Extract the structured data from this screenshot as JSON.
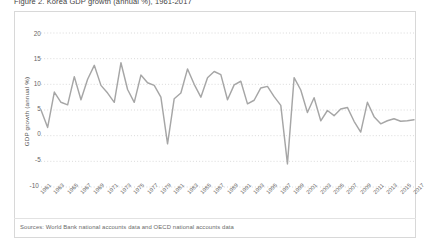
{
  "figure": {
    "title": "Figure 2. Korea GDP growth (annual %), 1961-2017",
    "source_note": "Sources: World Bank national accounts data and OECD national accounts data",
    "line_color": "#a6a6a6",
    "grid_color": "#d0d0d0",
    "border_color": "#d8d8d8",
    "text_color": "#666666"
  },
  "chart_data": {
    "type": "line",
    "title": "",
    "xlabel": "",
    "ylabel": "GDP growth (annual %)",
    "ylim": [
      -10,
      20
    ],
    "yticks": [
      20,
      15,
      10,
      5,
      0,
      -5,
      -10
    ],
    "ytick_labels": [
      "20",
      "15",
      "10",
      "5",
      "0",
      "-5",
      "-10"
    ],
    "grid": true,
    "grid_style": "dotted-horizontal",
    "legend": "none",
    "xlim": [
      1961,
      2017
    ],
    "xtick_labels": [
      "1961",
      "1963",
      "1965",
      "1967",
      "1969",
      "1971",
      "1973",
      "1975",
      "1977",
      "1979",
      "1981",
      "1983",
      "1985",
      "1987",
      "1989",
      "1991",
      "1993",
      "1995",
      "1997",
      "1999",
      "2001",
      "2003",
      "2005",
      "2007",
      "2009",
      "2011",
      "2013",
      "2015",
      "2017"
    ],
    "x": [
      1961,
      1962,
      1963,
      1964,
      1965,
      1966,
      1967,
      1968,
      1969,
      1970,
      1971,
      1972,
      1973,
      1974,
      1975,
      1976,
      1977,
      1978,
      1979,
      1980,
      1981,
      1982,
      1983,
      1984,
      1985,
      1986,
      1987,
      1988,
      1989,
      1990,
      1991,
      1992,
      1993,
      1994,
      1995,
      1996,
      1997,
      1998,
      1999,
      2000,
      2001,
      2002,
      2003,
      2004,
      2005,
      2006,
      2007,
      2008,
      2009,
      2010,
      2011,
      2012,
      2013,
      2014,
      2015,
      2016,
      2017
    ],
    "series": [
      {
        "name": "GDP growth (annual %)",
        "values": [
          5.0,
          1.6,
          8.5,
          6.5,
          6.0,
          11.5,
          7.0,
          11.0,
          13.7,
          9.8,
          8.3,
          6.5,
          14.2,
          9.0,
          6.5,
          11.8,
          10.3,
          9.8,
          7.5,
          -1.6,
          7.2,
          8.3,
          13.0,
          10.0,
          7.5,
          11.3,
          12.5,
          11.9,
          7.0,
          9.9,
          10.6,
          6.2,
          6.9,
          9.3,
          9.6,
          7.6,
          5.9,
          -5.5,
          11.3,
          8.9,
          4.5,
          7.4,
          2.9,
          4.9,
          3.9,
          5.2,
          5.5,
          2.8,
          0.7,
          6.5,
          3.7,
          2.3,
          2.9,
          3.3,
          2.8,
          2.9,
          3.1
        ]
      }
    ]
  }
}
